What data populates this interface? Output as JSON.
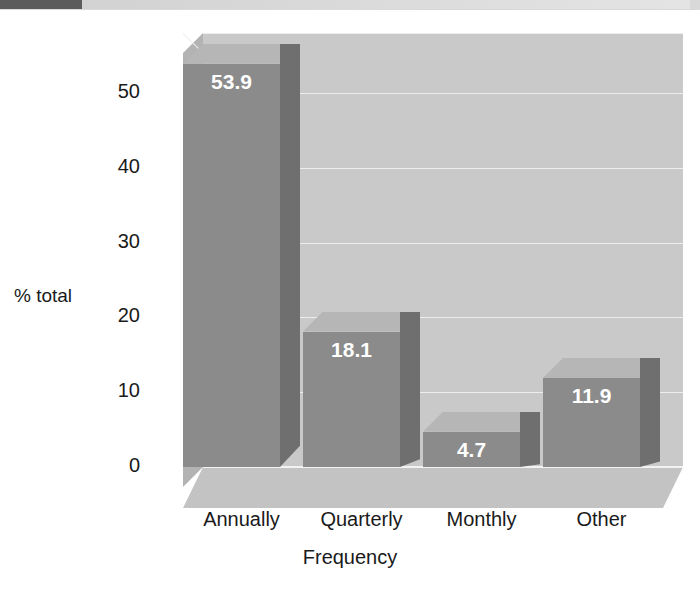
{
  "header": {
    "strip_dark_color": "#5b5b5b",
    "strip_light_color": "#d9d9d9"
  },
  "chart_data": {
    "type": "bar",
    "title": "",
    "subtitle": "",
    "xlabel": "Frequency",
    "ylabel": "% total",
    "categories": [
      "Annually",
      "Quarterly",
      "Monthly",
      "Other"
    ],
    "values": [
      53.9,
      18.1,
      4.7,
      11.9
    ],
    "value_labels": [
      "53.9",
      "18.1",
      "4.7",
      "11.9"
    ],
    "ylim": [
      0,
      58
    ],
    "yticks": [
      0,
      10,
      20,
      30,
      40,
      50
    ],
    "ytick_labels": [
      "0",
      "10",
      "20",
      "30",
      "40",
      "50"
    ],
    "grid": true,
    "gridlines_at": [
      10,
      20,
      30,
      40,
      50,
      58
    ],
    "legend": null,
    "legend_position": "none",
    "style": "3d-column",
    "colors": {
      "bar_front": "#8b8b8b",
      "bar_top": "#b6b6b6",
      "bar_side": "#6f6f6f",
      "back_wall": "#c9c9c9",
      "left_wall": "#b3b3b3",
      "floor": "#c3c3c3",
      "gridline": "#ededed",
      "text": "#1a1a1a",
      "value_text": "#ffffff",
      "background": "#ffffff"
    }
  }
}
